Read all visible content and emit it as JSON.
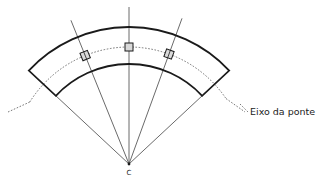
{
  "diagram": {
    "center_label": "C",
    "axis_label": "Eixo da ponte",
    "colors": {
      "line": "#1a1a1a",
      "thin_line": "#444444",
      "dashed": "#555555",
      "bearing_fill": "#d9d9d9"
    },
    "elements": {
      "band_end_angle_deg": 47,
      "radial_line_angles_deg": [
        -22,
        0,
        20
      ],
      "bearing_angles_deg": [
        -22,
        0,
        20
      ]
    }
  }
}
